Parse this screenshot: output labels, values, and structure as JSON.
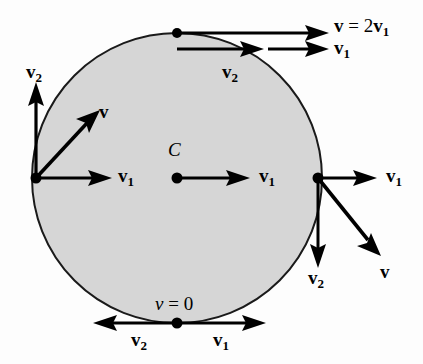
{
  "figure": {
    "colors": {
      "background": "#fdfdfd",
      "disk_fill": "#d6d6d6",
      "disk_stroke": "#1a1a1a",
      "vector": "#000000",
      "label": "#000000"
    },
    "geometry": {
      "circle": {
        "cx": 177,
        "cy": 178,
        "r": 145
      },
      "points": [
        {
          "name": "top-contact-point",
          "x": 177,
          "y": 33
        },
        {
          "name": "left-point",
          "x": 36,
          "y": 178
        },
        {
          "name": "center-point",
          "x": 177,
          "y": 178
        },
        {
          "name": "right-point",
          "x": 318,
          "y": 178
        },
        {
          "name": "bottom-contact-point",
          "x": 177,
          "y": 323
        }
      ]
    },
    "labels": [
      {
        "id": "top-v-sum",
        "text_main": "v",
        "text_eq": " = 2",
        "text_sub_main": "v",
        "sub": "1",
        "x": 334,
        "y": 18,
        "kind": "bold"
      },
      {
        "id": "top-v1",
        "text_main": "v",
        "sub": "1",
        "x": 334,
        "y": 40,
        "kind": "bold"
      },
      {
        "id": "top-v2",
        "text_main": "v",
        "sub": "2",
        "x": 222,
        "y": 63,
        "kind": "bold"
      },
      {
        "id": "left-v2",
        "text_main": "v",
        "sub": "2",
        "x": 26,
        "y": 64,
        "kind": "bold"
      },
      {
        "id": "left-v",
        "text_main": "v",
        "sub": "",
        "x": 97,
        "y": 103,
        "kind": "bold"
      },
      {
        "id": "left-v1",
        "text_main": "v",
        "sub": "1",
        "x": 117,
        "y": 166,
        "kind": "bold"
      },
      {
        "id": "center-c",
        "text_main": "C",
        "sub": "",
        "x": 168,
        "y": 143,
        "kind": "italic"
      },
      {
        "id": "center-v1",
        "text_main": "v",
        "sub": "1",
        "x": 259,
        "y": 166,
        "kind": "bold"
      },
      {
        "id": "right-v1",
        "text_main": "v",
        "sub": "1",
        "x": 386,
        "y": 166,
        "kind": "bold"
      },
      {
        "id": "right-v2",
        "text_main": "v",
        "sub": "2",
        "x": 308,
        "y": 265,
        "kind": "bold"
      },
      {
        "id": "right-v",
        "text_main": "v",
        "sub": "",
        "x": 379,
        "y": 260,
        "kind": "bold"
      },
      {
        "id": "bottom-v-zero",
        "text_main": "v",
        "text_eq": " = 0",
        "sub": "",
        "x": 156,
        "y": 295,
        "kind": "italic"
      },
      {
        "id": "bottom-v2",
        "text_main": "v",
        "sub": "2",
        "x": 131,
        "y": 330,
        "kind": "bold"
      },
      {
        "id": "bottom-v1",
        "text_main": "v",
        "sub": "1",
        "x": 213,
        "y": 330,
        "kind": "bold"
      }
    ],
    "vectors": [
      {
        "name": "top-resultant-v",
        "from": [
          177,
          33
        ],
        "to": [
          325,
          33
        ],
        "label": "v = 2v1"
      },
      {
        "name": "top-component-v2",
        "from": [
          177,
          48
        ],
        "to": [
          258,
          48
        ],
        "label": "v2"
      },
      {
        "name": "top-component-v1",
        "from": [
          258,
          48
        ],
        "to": [
          325,
          48
        ],
        "label": "v1"
      },
      {
        "name": "left-component-v2",
        "from": [
          36,
          178
        ],
        "to": [
          36,
          80
        ],
        "label": "v2"
      },
      {
        "name": "left-resultant-v",
        "from": [
          36,
          178
        ],
        "to": [
          105,
          105
        ],
        "label": "v"
      },
      {
        "name": "left-component-v1",
        "from": [
          36,
          178
        ],
        "to": [
          110,
          178
        ],
        "label": "v1"
      },
      {
        "name": "center-v1",
        "from": [
          177,
          178
        ],
        "to": [
          250,
          178
        ],
        "label": "v1"
      },
      {
        "name": "right-component-v1",
        "from": [
          318,
          178
        ],
        "to": [
          377,
          178
        ],
        "label": "v1"
      },
      {
        "name": "right-component-v2",
        "from": [
          318,
          178
        ],
        "to": [
          318,
          268
        ],
        "label": "v2"
      },
      {
        "name": "right-resultant-v",
        "from": [
          318,
          178
        ],
        "to": [
          381,
          257
        ],
        "label": "v"
      },
      {
        "name": "bottom-component-v2",
        "from": [
          177,
          323
        ],
        "to": [
          95,
          323
        ],
        "label": "v2"
      },
      {
        "name": "bottom-component-v1",
        "from": [
          177,
          323
        ],
        "to": [
          264,
          323
        ],
        "label": "v1"
      }
    ]
  }
}
